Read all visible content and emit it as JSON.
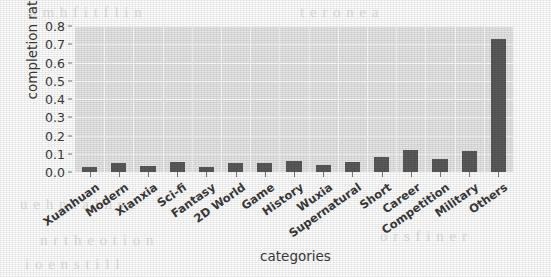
{
  "chart_data": {
    "type": "bar",
    "title": "",
    "xlabel": "categories",
    "ylabel": "completion ratio",
    "categories": [
      "Xuanhuan",
      "Modern",
      "Xianxia",
      "Sci-fi",
      "Fantasy",
      "2D World",
      "Game",
      "History",
      "Wuxia",
      "Supernatural",
      "Short",
      "Career",
      "Competition",
      "Military",
      "Others"
    ],
    "values": [
      0.03,
      0.05,
      0.035,
      0.055,
      0.025,
      0.05,
      0.05,
      0.06,
      0.04,
      0.055,
      0.08,
      0.12,
      0.07,
      0.115,
      0.105
    ],
    "ylim": [
      0.0,
      0.8
    ],
    "yticks": [
      "0.0",
      "0.1",
      "0.2",
      "0.3",
      "0.4",
      "0.5",
      "0.6",
      "0.7",
      "0.8"
    ],
    "ytick_values": [
      0.0,
      0.1,
      0.2,
      0.3,
      0.4,
      0.5,
      0.6,
      0.7,
      0.8
    ],
    "grid": true,
    "legend": false,
    "bar_color": "#5a5a5a",
    "plot_background": "#e6e6e6",
    "gridline_color": "#fbfbfb"
  },
  "overrides": {
    "note": "final bar 'Others' is the tall outlier",
    "others_value": 0.73
  },
  "page_bleed": {
    "lines": [
      "a m  h f   i   t   f  l   i n",
      "   t  e  r   o   n   e   a",
      "u  e   h n  t   a  i   n   s  e",
      "n  r  t  h e   o  t  i  o  n",
      "i o   e    n    s  t  i  l l",
      "o  r   s     f  i  n   e    r"
    ]
  }
}
